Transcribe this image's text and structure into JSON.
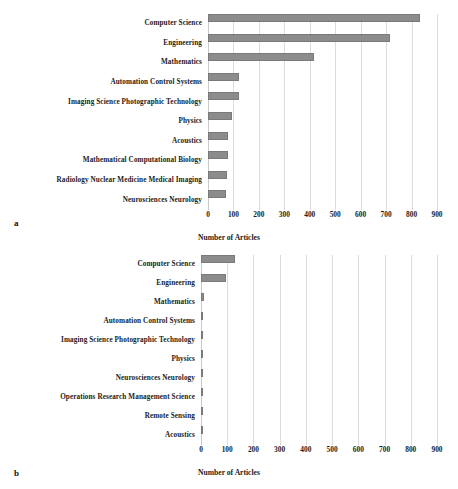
{
  "figure": {
    "panels": [
      {
        "letter": "a"
      },
      {
        "letter": "b"
      }
    ]
  },
  "chart_data": [
    {
      "type": "bar",
      "orientation": "horizontal",
      "panel": "a",
      "title": "",
      "xlabel": "Number of Articles",
      "ylabel": "",
      "xlim": [
        0,
        900
      ],
      "xticks": [
        0,
        100,
        200,
        300,
        400,
        500,
        600,
        700,
        800,
        900
      ],
      "tick_labels": [
        "0",
        "100",
        "200",
        "300",
        "400",
        "500",
        "600",
        "700",
        "800",
        "900"
      ],
      "grid": true,
      "legend": "none",
      "bar_color": "#8c8c8c",
      "categories": [
        "Computer Science",
        "Engineering",
        "Mathematics",
        "Automation Control Systems",
        "Imaging Science Photographic Technology",
        "Physics",
        "Acoustics",
        "Mathematical Computational Biology",
        "Radiology Nuclear Medicine Medical Imaging",
        "Neurosciences Neurology"
      ],
      "values": [
        835,
        715,
        415,
        120,
        120,
        95,
        78,
        78,
        75,
        72
      ]
    },
    {
      "type": "bar",
      "orientation": "horizontal",
      "panel": "b",
      "title": "",
      "xlabel": "Number of Articles",
      "ylabel": "",
      "xlim": [
        0,
        900
      ],
      "xticks": [
        0,
        100,
        200,
        300,
        400,
        500,
        600,
        700,
        800,
        900
      ],
      "tick_labels": [
        "0",
        "100",
        "200",
        "300",
        "400",
        "500",
        "600",
        "700",
        "800",
        "900"
      ],
      "grid": true,
      "legend": "none",
      "bar_color": "#8c8c8c",
      "categories": [
        "Computer Science",
        "Engineering",
        "Mathematics",
        "Automation Control Systems",
        "Imaging Science Photographic Technology",
        "Physics",
        "Neurosciences Neurology",
        "Operations Research Management Science",
        "Remote Sensing",
        "Acoustics"
      ],
      "values": [
        131,
        95,
        10,
        9,
        8,
        8,
        7,
        5,
        5,
        4
      ]
    }
  ]
}
